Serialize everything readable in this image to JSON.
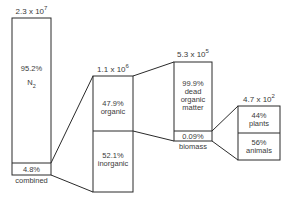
{
  "diagram": {
    "type": "nitrogen-reservoir-breakdown",
    "stroke_color": "#2a2a2a",
    "boxes": [
      {
        "id": "total",
        "total_label": {
          "base": "2.3 x 10",
          "exp": "7"
        },
        "upper": {
          "percent": "95.2%",
          "label": "N",
          "subscript": "2"
        },
        "lower": {
          "percent": "4.8%"
        },
        "below_label": "combined"
      },
      {
        "id": "combined",
        "total_label": {
          "base": "1.1 x 10",
          "exp": "6"
        },
        "upper": {
          "percent": "47.9%",
          "label": "organic"
        },
        "lower": {
          "percent": "52.1%",
          "label": "inorganic"
        }
      },
      {
        "id": "organic",
        "total_label": {
          "base": "5.3 x 10",
          "exp": "5"
        },
        "upper": {
          "percent": "99.9%",
          "label_lines": [
            "dead",
            "organic",
            "matter"
          ]
        },
        "lower": {
          "percent": "0.09%"
        },
        "below_label": "biomass"
      },
      {
        "id": "biomass",
        "total_label": {
          "base": "4.7 x 10",
          "exp": "2"
        },
        "upper": {
          "percent": "44%",
          "label": "plants"
        },
        "lower": {
          "percent": "56%",
          "label": "animals"
        }
      }
    ]
  }
}
